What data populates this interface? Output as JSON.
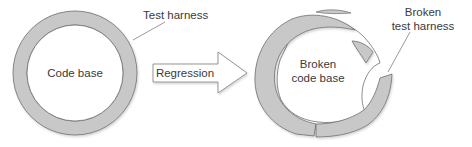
{
  "diagram": {
    "type": "concept-diagram",
    "colors": {
      "ring_fill": "#c8c8c8",
      "ring_stroke": "#6e6e6e",
      "inner_fill": "#ffffff",
      "text": "#3a3a3a",
      "leader_line": "#6e6e6e",
      "arrow_stroke": "#8a8a8a"
    },
    "left": {
      "center_label": "Code base",
      "ring_label": "Test harness"
    },
    "arrow": {
      "label": "Regression"
    },
    "right": {
      "center_label_line1": "Broken",
      "center_label_line2": "code base",
      "ring_label_line1": "Broken",
      "ring_label_line2": "test harness"
    }
  }
}
